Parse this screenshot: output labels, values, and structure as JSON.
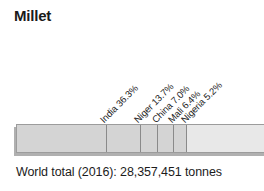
{
  "chart_data": {
    "type": "bar",
    "subtype": "stacked-horizontal-100-percent",
    "title": "Millet",
    "xlabel": "",
    "ylabel": "",
    "caption": "World total (2016): 28,357,451 tonnes",
    "total_label_prefix": "World total (2016):",
    "total_value": "28,357,451",
    "total_units": "tonnes",
    "year": "2016",
    "grid": false,
    "legend": "none",
    "axis_range_percent": [
      0,
      100
    ],
    "categories": [
      "India",
      "Niger",
      "China",
      "Mali",
      "Nigeria",
      "Other"
    ],
    "values": [
      36.3,
      13.7,
      7.0,
      6.4,
      5.2,
      31.4
    ],
    "labels": [
      "India 36.3%",
      "Niger 13.7%",
      "China 7.0%",
      "Mali 6.4%",
      "Nigeria 5.2%"
    ],
    "cumulative_percent": [
      36.3,
      50.0,
      57.0,
      63.4,
      68.6,
      100.0
    ],
    "label_anchor_percent": [
      36.3,
      50.0,
      57.0,
      63.4,
      68.6
    ],
    "colors": {
      "segment_fill": "#d4d4d4",
      "other_fill": "#e8e8e8",
      "divider": "#8a8a8a",
      "border": "#9c9c9c",
      "shadow": "#b0b0b0",
      "text": "#1c1c1c",
      "background": "#ffffff"
    }
  }
}
